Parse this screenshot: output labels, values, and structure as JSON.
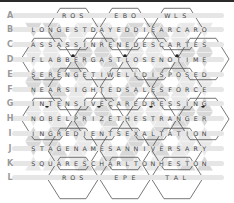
{
  "puzzle": {
    "type": "hexagonal word grid",
    "rows": [
      {
        "label": "A",
        "segments": [
          "ROS",
          "EBO",
          "WLS"
        ]
      },
      {
        "label": "B",
        "text": "LONGESTDAYEDDIEARCARO"
      },
      {
        "label": "C",
        "text": "ASSASSINRENEDESCARTES"
      },
      {
        "label": "D",
        "text": "FLABBERGASTLOSENOTIME"
      },
      {
        "label": "E",
        "text": "SERENGETIWELLDISPOSED"
      },
      {
        "label": "F",
        "text": "NEARSIGHTEDSALESFORCE"
      },
      {
        "label": "G",
        "text": "INTENSIVECAREDRESSING"
      },
      {
        "label": "H",
        "text": "NOBELPRIZETHESTRANGER"
      },
      {
        "label": "I",
        "text": "INGREDIENTSEXALTATION"
      },
      {
        "label": "J",
        "text": "STAGENAMESANNIVERSARY"
      },
      {
        "label": "K",
        "text": "SQUARESCHARLTONHESTON"
      },
      {
        "label": "L",
        "segments": [
          "ROS",
          "EPE",
          "TAL"
        ]
      }
    ]
  },
  "colors": {
    "label": "#9a9a9a",
    "bar": "#e6e6e6",
    "shade_dark": "#c8c8c8",
    "shade_light": "#e0e0e0",
    "line": "#555555",
    "dot": "#222222"
  }
}
